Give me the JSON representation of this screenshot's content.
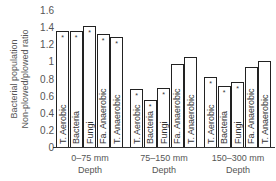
{
  "chart_data": {
    "type": "bar",
    "title": "",
    "xlabel": "Depth",
    "ylabel": "Bacterial population Non-plowed/plowed ratio",
    "ylabel_lines": [
      "Bacterial population",
      "Non-plowed/plowed ratio"
    ],
    "ylim": [
      0,
      1.6
    ],
    "yticks": [
      "0",
      "0.2",
      "0.4",
      "0.6",
      "0.8",
      "1",
      "1.2",
      "1.4",
      "1.6"
    ],
    "grid": false,
    "legend": "none",
    "categories": [
      "0–75 mm",
      "75–150 mm",
      "150–300 mm"
    ],
    "series_labels": [
      "T. Aerobic",
      "Bacteria",
      "Fungi",
      "Fa. Anaerobic",
      "T. Anaerobic"
    ],
    "groups": [
      {
        "category": "0–75 mm",
        "axis_label": "Depth",
        "bars": [
          {
            "label": "T. Aerobic",
            "value": 1.35,
            "significant": true
          },
          {
            "label": "Bacteria",
            "value": 1.35,
            "significant": true
          },
          {
            "label": "Fungi",
            "value": 1.41,
            "significant": true
          },
          {
            "label": "Fa. Anaerobic",
            "value": 1.32,
            "significant": true
          },
          {
            "label": "T. Anaerobic",
            "value": 1.28,
            "significant": true
          }
        ]
      },
      {
        "category": "75–150 mm",
        "axis_label": "Depth",
        "bars": [
          {
            "label": "T. Aerobic",
            "value": 0.68,
            "significant": true
          },
          {
            "label": "Bacteria",
            "value": 0.55,
            "significant": true
          },
          {
            "label": "Fungi",
            "value": 0.69,
            "significant": true
          },
          {
            "label": "Fa. Anaerobic",
            "value": 0.97,
            "significant": false
          },
          {
            "label": "T. Anaerobic",
            "value": 1.05,
            "significant": false
          }
        ]
      },
      {
        "category": "150–300 mm",
        "axis_label": "Depth",
        "bars": [
          {
            "label": "T. Aerobic",
            "value": 0.82,
            "significant": true
          },
          {
            "label": "Bacteria",
            "value": 0.71,
            "significant": true
          },
          {
            "label": "Fungi",
            "value": 0.76,
            "significant": true
          },
          {
            "label": "Fa. Anaerobic",
            "value": 0.94,
            "significant": false
          },
          {
            "label": "T. Anaerobic",
            "value": 1.0,
            "significant": false
          }
        ]
      }
    ],
    "significance_marker": "*"
  }
}
